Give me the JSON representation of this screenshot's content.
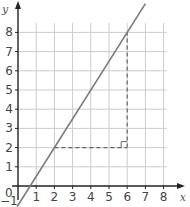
{
  "chart_data": {
    "type": "line",
    "title": "",
    "xlabel": "x",
    "ylabel": "y",
    "xlim": [
      -1,
      8.5
    ],
    "ylim": [
      -1,
      8.5
    ],
    "grid": true,
    "x_ticks": [
      1,
      2,
      3,
      4,
      5,
      6,
      7,
      8
    ],
    "y_ticks": [
      1,
      2,
      3,
      4,
      5,
      6,
      7,
      8
    ],
    "origin_label": "0",
    "y_intercept_label": "-1",
    "series": [
      {
        "name": "y = 1.5x - 1",
        "points": [
          [
            -0.05,
            -1.08
          ],
          [
            7.0,
            9.5
          ]
        ],
        "color": "#7a7a7a"
      }
    ],
    "annotations": [
      {
        "type": "dashed-segment",
        "from": [
          2,
          2
        ],
        "to": [
          6,
          2
        ],
        "label": "run"
      },
      {
        "type": "dashed-segment",
        "from": [
          6,
          2
        ],
        "to": [
          6,
          8
        ],
        "label": "rise"
      },
      {
        "type": "right-angle-marker",
        "at": [
          6,
          2
        ]
      }
    ]
  },
  "colors": {
    "axis": "#222222",
    "grid": "#cccccc",
    "line": "#7a7a7a",
    "dashed": "#666666"
  }
}
